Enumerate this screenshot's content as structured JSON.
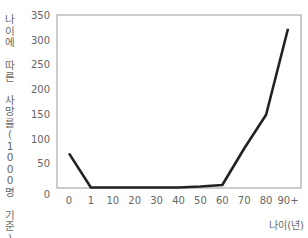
{
  "chart_data": {
    "type": "line",
    "title": "",
    "xlabel": "나이(년)",
    "ylabel": "나이에 따른 사망률(1000명 기준)",
    "categories": [
      "0",
      "1",
      "10",
      "20",
      "30",
      "40",
      "50",
      "60",
      "70",
      "80",
      "90+"
    ],
    "series": [
      {
        "name": "사망률",
        "values": [
          70,
          1,
          1,
          1,
          1,
          1,
          3,
          6,
          80,
          148,
          322
        ]
      }
    ],
    "yticks": [
      0,
      50,
      100,
      150,
      200,
      250,
      300,
      350
    ],
    "ylim": [
      0,
      350
    ],
    "grid": false,
    "legend": "none",
    "line_color": "#222222"
  },
  "axis": {
    "ylabel_chars": [
      "나",
      "이",
      "에",
      " ",
      "따",
      "른",
      " ",
      "사",
      "망",
      "률",
      "(",
      "1",
      "0",
      "0",
      "0",
      "명",
      " ",
      "기",
      "준",
      ")"
    ],
    "xlabel": "나이(년)"
  }
}
